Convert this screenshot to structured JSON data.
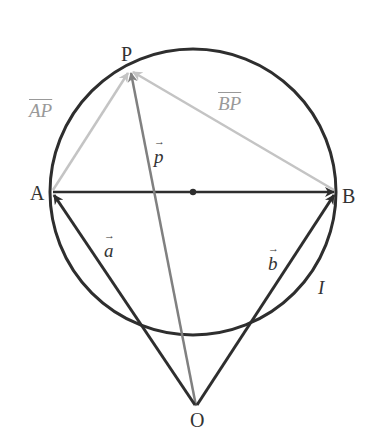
{
  "diagram": {
    "type": "vector-geometry",
    "circle": {
      "cx": 193,
      "cy": 192,
      "r": 143,
      "label": "I"
    },
    "points": {
      "P": {
        "label": "P",
        "x": 130,
        "y": 70
      },
      "A": {
        "label": "A",
        "x": 51,
        "y": 192
      },
      "B": {
        "label": "B",
        "x": 336,
        "y": 192
      },
      "O": {
        "label": "O",
        "x": 196,
        "y": 408
      },
      "center": {
        "x": 193,
        "y": 192
      }
    },
    "vectors": {
      "a": {
        "label": "a",
        "from": "O",
        "to": "A"
      },
      "b": {
        "label": "b",
        "from": "O",
        "to": "B"
      },
      "p": {
        "label": "p",
        "from": "O",
        "to": "P"
      },
      "AP": {
        "label": "AP",
        "from": "A",
        "to": "P"
      },
      "BP": {
        "label": "BP",
        "from": "B",
        "to": "P"
      },
      "AB": {
        "label": "",
        "from": "A",
        "to": "B"
      }
    },
    "colors": {
      "dark": "#2e2e2e",
      "mid": "#808080",
      "light": "#c4c4c4",
      "label_grey": "#9a9a9a"
    }
  }
}
